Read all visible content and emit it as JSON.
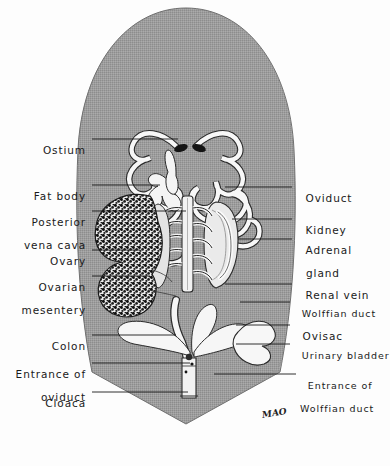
{
  "figure": {
    "signature": "MAO",
    "caption": "",
    "colors": {
      "body_fill": "#9a9a9a",
      "body_stroke": "#6f6f6f",
      "organ_fill": "#f6f6f6",
      "organ_stroke": "#2b2b2b",
      "leader_line": "#1a1a1a",
      "ostium_dark": "#141414",
      "paper": "#fdfdfd",
      "text": "#1a1a1a"
    }
  },
  "labels_left": [
    {
      "name": "ostium",
      "line1": "Ostium",
      "line2": "",
      "x_end": 86,
      "y": 140,
      "leader_to": 178
    },
    {
      "name": "fat-body",
      "line1": "Fat body",
      "line2": "",
      "x_end": 86,
      "y": 186,
      "leader_to": 160
    },
    {
      "name": "posterior-vena-cava",
      "line1": "Posterior",
      "line2": "vena cava",
      "x_end": 86,
      "y": 212,
      "leader_to": 186
    },
    {
      "name": "ovary",
      "line1": "Ovary",
      "line2": "",
      "x_end": 86,
      "y": 251,
      "leader_to": 140
    },
    {
      "name": "ovarian-mesentery",
      "line1": "Ovarian",
      "line2": "mesentery",
      "x_end": 86,
      "y": 277,
      "leader_to": 150
    },
    {
      "name": "colon",
      "line1": "Colon",
      "line2": "",
      "x_end": 86,
      "y": 336,
      "leader_to": 176
    },
    {
      "name": "entrance-of-oviduct",
      "line1": "Entrance of",
      "line2": "oviduct",
      "x_end": 86,
      "y": 364,
      "leader_to": 190
    },
    {
      "name": "cloaca",
      "line1": "Cloaca",
      "line2": "",
      "x_end": 86,
      "y": 393,
      "leader_to": 188
    }
  ],
  "labels_right": [
    {
      "name": "oviduct",
      "line1": "Oviduct",
      "line2": "",
      "x_start": 297,
      "y": 188,
      "leader_from": 225
    },
    {
      "name": "kidney",
      "line1": "Kidney",
      "line2": "",
      "x_start": 297,
      "y": 220,
      "leader_from": 232
    },
    {
      "name": "adrenal-gland",
      "line1": "Adrenal",
      "line2": "gland",
      "x_start": 297,
      "y": 240,
      "leader_from": 238
    },
    {
      "name": "renal-vein",
      "line1": "Renal vein",
      "line2": "",
      "x_start": 297,
      "y": 285,
      "leader_from": 225
    },
    {
      "name": "wolffian-duct",
      "line1": "Wolffian duct",
      "line2": "",
      "x_start": 294,
      "y": 303,
      "leader_from": 240
    },
    {
      "name": "ovisac",
      "line1": "Ovisac",
      "line2": "",
      "x_start": 294,
      "y": 326,
      "leader_from": 236
    },
    {
      "name": "urinary-bladder",
      "line1": "Urinary bladder",
      "line2": "",
      "x_start": 294,
      "y": 345,
      "leader_from": 236
    },
    {
      "name": "entrance-of-wolffian-duct",
      "line1": "Entrance of",
      "line2": "Wolffian duct",
      "x_start": 300,
      "y": 375,
      "leader_from": 214
    }
  ]
}
